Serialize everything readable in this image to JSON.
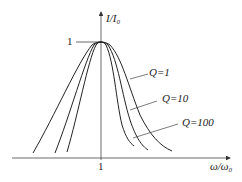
{
  "diagram": {
    "type": "resonance-curves",
    "y_axis_label": "I/I₀",
    "x_axis_label": "ω/ω₀",
    "y_tick": "1",
    "x_tick": "1",
    "curves": [
      {
        "label": "Q=1",
        "position": "outermost (widest)"
      },
      {
        "label": "Q=10",
        "position": "middle"
      },
      {
        "label": "Q=100",
        "position": "innermost (narrowest)"
      }
    ],
    "line_color": "#222222"
  }
}
